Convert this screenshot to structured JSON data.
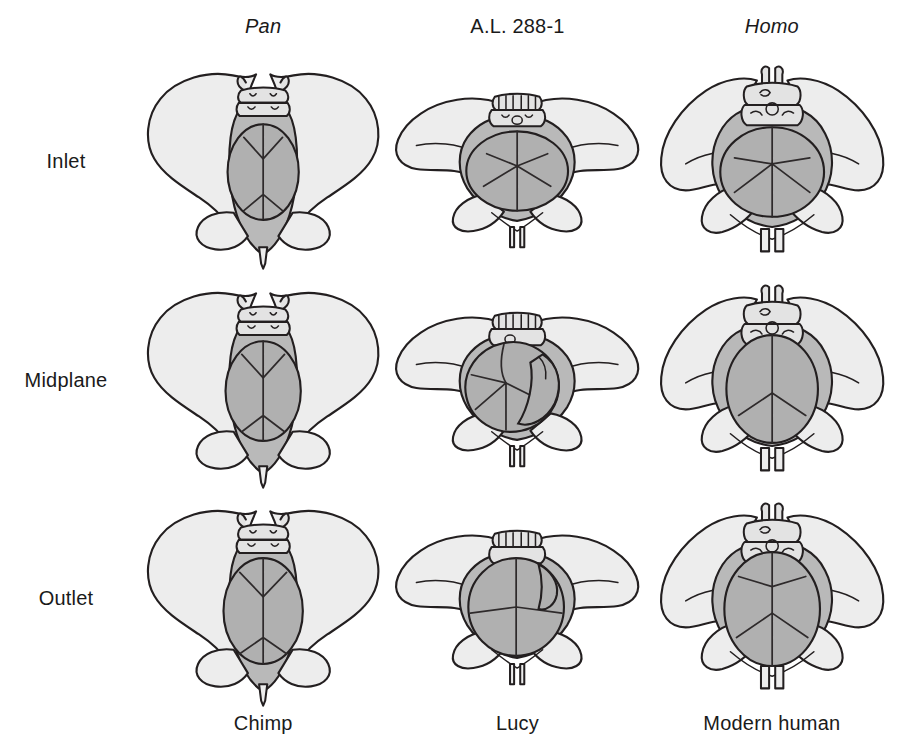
{
  "figure": {
    "columns": [
      {
        "id": "pan",
        "taxon": "Pan",
        "taxon_italic": true,
        "common_name": "Chimp"
      },
      {
        "id": "al288",
        "taxon": "A.L. 288-1",
        "taxon_italic": false,
        "common_name": "Lucy"
      },
      {
        "id": "homo",
        "taxon": "Homo",
        "taxon_italic": true,
        "common_name": "Modern human"
      }
    ],
    "rows": [
      {
        "id": "inlet",
        "label": "Inlet"
      },
      {
        "id": "midplane",
        "label": "Midplane"
      },
      {
        "id": "outlet",
        "label": "Outlet"
      }
    ],
    "colors": {
      "background": "#ffffff",
      "bone_fill": "#ededed",
      "sacrum_fill": "#e3e3e3",
      "pelvic_canal_fill": "#b9b9b9",
      "fetal_head_fill": "#b0b0b0",
      "outline": "#231f20",
      "suture_line": "#2e2a2b",
      "text": "#1a1a1a"
    },
    "cells": [
      {
        "row": "inlet",
        "column": "pan",
        "canal_shape": "narrow-oval-anteroposterior",
        "head_orientation": "anteroposterior",
        "head_fit": "head smaller than canal, ample clearance"
      },
      {
        "row": "inlet",
        "column": "al288",
        "canal_shape": "wide-platypelloid-transverse",
        "head_orientation": "transverse",
        "head_fit": "head nearly fills transverse canal"
      },
      {
        "row": "inlet",
        "column": "homo",
        "canal_shape": "round-transverse-oval",
        "head_orientation": "transverse",
        "head_fit": "head nearly fills canal"
      },
      {
        "row": "midplane",
        "column": "pan",
        "canal_shape": "narrow-oval-anteroposterior",
        "head_orientation": "anteroposterior",
        "head_fit": "head smaller than canal, clearance remains"
      },
      {
        "row": "midplane",
        "column": "al288",
        "canal_shape": "wide-platypelloid-transverse",
        "head_orientation": "oblique-rotated",
        "head_fit": "head rotating, tight fit against canal wall"
      },
      {
        "row": "midplane",
        "column": "homo",
        "canal_shape": "round-to-oval",
        "head_orientation": "anteroposterior",
        "head_fit": "head rotated to AP, fills canal"
      },
      {
        "row": "outlet",
        "column": "pan",
        "canal_shape": "narrow-oval-anteroposterior",
        "head_orientation": "anteroposterior",
        "head_fit": "head fits with clearance"
      },
      {
        "row": "outlet",
        "column": "al288",
        "canal_shape": "wide-transverse-outlet",
        "head_orientation": "transverse",
        "head_fit": "head re-rotated to transverse, fills outlet"
      },
      {
        "row": "outlet",
        "column": "homo",
        "canal_shape": "anteroposterior-oval-outlet",
        "head_orientation": "anteroposterior",
        "head_fit": "head fills outlet in AP orientation"
      }
    ]
  }
}
